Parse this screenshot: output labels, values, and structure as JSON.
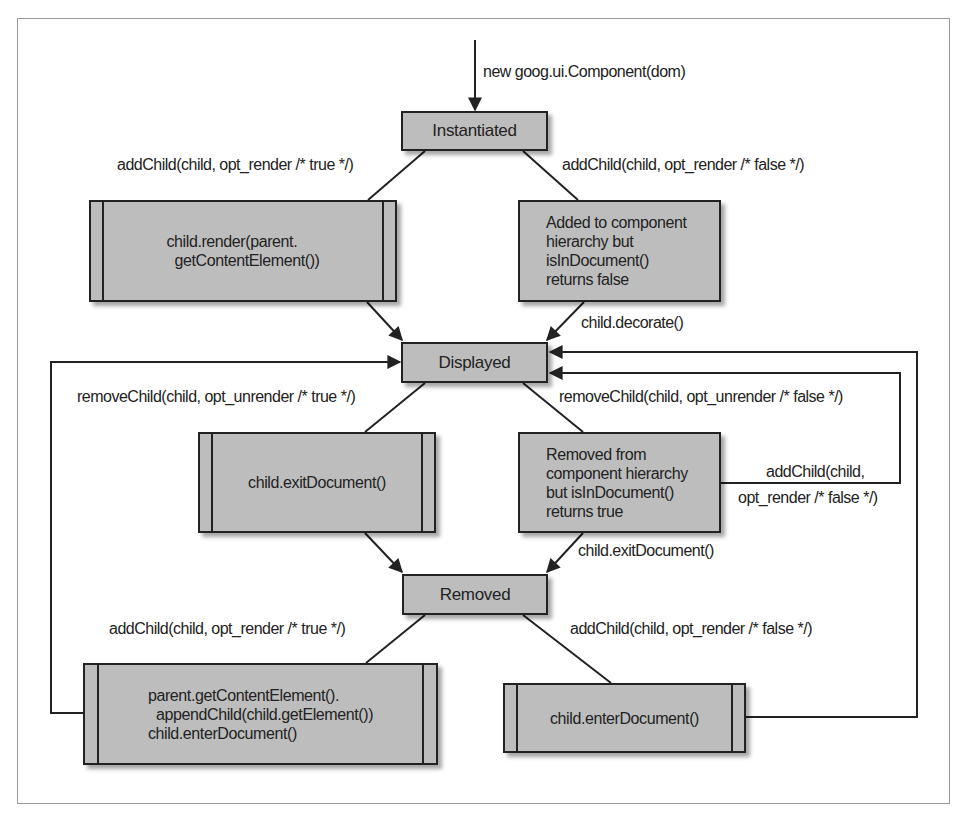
{
  "diagram": {
    "type": "state-transition",
    "colors": {
      "node_fill": "#bdbdbd",
      "stroke": "#222222",
      "frame": "#9a9a9a",
      "background": "#ffffff"
    },
    "states": {
      "instantiated": "Instantiated",
      "displayed": "Displayed",
      "removed": "Removed"
    },
    "process_boxes": {
      "render": "child.render(parent.\n  getContentElement())",
      "exit_document": "child.exitDocument()",
      "append_enter": "parent.getContentElement().\n  appendChild(child.getElement())\nchild.enterDocument()",
      "enter_document": "child.enterDocument()"
    },
    "note_boxes": {
      "added_not_in_doc": "Added to component\nhierarchy but\nisInDocument()\nreturns false",
      "removed_in_doc": "Removed from\ncomponent hierarchy\nbut isInDocument()\nreturns true"
    },
    "edge_labels": {
      "constructor": "new goog.ui.Component(dom)",
      "add_child_render_true_top": "addChild(child, opt_render /* true */)",
      "add_child_render_false_top": "addChild(child, opt_render /* false */)",
      "decorate": "child.decorate()",
      "remove_child_unrender_true": "removeChild(child, opt_unrender /* true */)",
      "remove_child_unrender_false": "removeChild(child, opt_unrender /* false */)",
      "add_child_loop_line1": "addChild(child,",
      "add_child_loop_line2": "opt_render /* false */)",
      "exit_document_edge": "child.exitDocument()",
      "add_child_render_true_bottom": "addChild(child, opt_render /* true */)",
      "add_child_render_false_bottom": "addChild(child, opt_render /* false */)"
    },
    "edges": [
      {
        "from": "start",
        "to": "Instantiated",
        "label": "new goog.ui.Component(dom)"
      },
      {
        "from": "Instantiated",
        "to": "child.render(parent.getContentElement())",
        "label": "addChild(child, opt_render /* true */)"
      },
      {
        "from": "Instantiated",
        "to": "Added to component hierarchy but isInDocument() returns false",
        "label": "addChild(child, opt_render /* false */)"
      },
      {
        "from": "child.render(parent.getContentElement())",
        "to": "Displayed",
        "label": ""
      },
      {
        "from": "Added to component hierarchy but isInDocument() returns false",
        "to": "Displayed",
        "label": "child.decorate()"
      },
      {
        "from": "Displayed",
        "to": "child.exitDocument()",
        "label": "removeChild(child, opt_unrender /* true */)"
      },
      {
        "from": "Displayed",
        "to": "Removed from component hierarchy but isInDocument() returns true",
        "label": "removeChild(child, opt_unrender /* false */)"
      },
      {
        "from": "Removed from component hierarchy but isInDocument() returns true",
        "to": "Displayed",
        "label": "addChild(child, opt_render /* false */)"
      },
      {
        "from": "child.exitDocument()",
        "to": "Removed",
        "label": ""
      },
      {
        "from": "Removed from component hierarchy but isInDocument() returns true",
        "to": "Removed",
        "label": "child.exitDocument()"
      },
      {
        "from": "Removed",
        "to": "parent.getContentElement().appendChild(child.getElement()) child.enterDocument()",
        "label": "addChild(child, opt_render /* true */)"
      },
      {
        "from": "Removed",
        "to": "child.enterDocument()",
        "label": "addChild(child, opt_render /* false */)"
      },
      {
        "from": "parent.getContentElement().appendChild(child.getElement()) child.enterDocument()",
        "to": "Displayed",
        "label": ""
      },
      {
        "from": "child.enterDocument()",
        "to": "Displayed",
        "label": ""
      }
    ]
  }
}
